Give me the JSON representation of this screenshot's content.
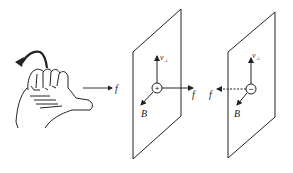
{
  "figure": {
    "hand": {
      "icon": "left-hand-icon",
      "arrow_label": "f"
    },
    "panel_positive": {
      "charge_symbol": "+",
      "velocity_label": "v",
      "velocity_subscript": "⊥",
      "field_label": "B",
      "force_label": "f",
      "force_direction": "right"
    },
    "panel_negative": {
      "charge_symbol": "−",
      "velocity_label": "v",
      "velocity_subscript": "⊥",
      "field_label": "B",
      "force_label": "f",
      "force_direction": "left",
      "force_style": "dashed"
    },
    "colors": {
      "stroke": "#222222",
      "background": "#ffffff"
    }
  }
}
